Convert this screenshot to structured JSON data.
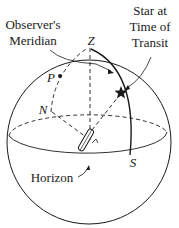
{
  "diagram": {
    "labels": {
      "observers_meridian_line1": "Observer's",
      "observers_meridian_line2": "Meridian",
      "star_line1": "Star at",
      "star_line2": "Time of",
      "star_line3": "Transit",
      "zenith": "Z",
      "pole": "P",
      "north": "N",
      "south": "S",
      "horizon": "Horizon"
    },
    "colors": {
      "ink": "#1a1a1a",
      "background": "#ffffff"
    }
  }
}
